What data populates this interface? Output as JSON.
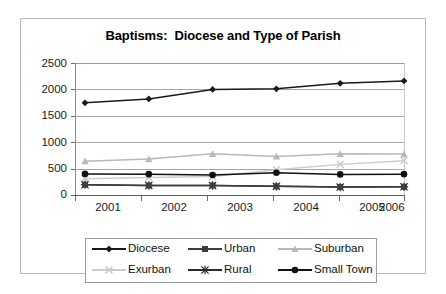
{
  "chart_data": {
    "type": "line",
    "title": "Baptisms:  Diocese and Type of Parish",
    "xlabel": "",
    "ylabel": "",
    "categories": [
      "2001",
      "2002",
      "2003",
      "2004",
      "2005",
      "2006"
    ],
    "ylim": [
      0,
      2500
    ],
    "yticks": [
      0,
      500,
      1000,
      1500,
      2000,
      2500
    ],
    "grid": true,
    "legend_position": "bottom",
    "series": [
      {
        "name": "Diocese",
        "marker": "diamond",
        "color": "#1a1a1a",
        "values": [
          1745,
          1820,
          2000,
          2010,
          2115,
          2160
        ]
      },
      {
        "name": "Urban",
        "marker": "square",
        "color": "#3d3d3d",
        "values": [
          195,
          180,
          180,
          165,
          150,
          155
        ]
      },
      {
        "name": "Suburban",
        "marker": "triangle",
        "color": "#b8b8b8",
        "values": [
          640,
          680,
          780,
          730,
          780,
          775
        ]
      },
      {
        "name": "Exurban",
        "marker": "cross-x",
        "color": "#cccccc",
        "values": [
          310,
          330,
          350,
          480,
          580,
          650
        ]
      },
      {
        "name": "Rural",
        "marker": "asterisk",
        "color": "#2b2b2b",
        "values": [
          195,
          180,
          180,
          165,
          150,
          155
        ]
      },
      {
        "name": "Small Town",
        "marker": "circle",
        "color": "#111111",
        "values": [
          400,
          395,
          380,
          420,
          390,
          395
        ]
      }
    ]
  },
  "legend": {
    "rows": [
      [
        {
          "label": "Diocese"
        },
        {
          "label": "Urban"
        },
        {
          "label": "Suburban"
        }
      ],
      [
        {
          "label": "Exurban"
        },
        {
          "label": "Rural"
        },
        {
          "label": "Small Town"
        }
      ]
    ]
  },
  "axes": {
    "ytick_labels": [
      "2500",
      "2000",
      "1500",
      "1000",
      "500",
      "0"
    ],
    "xtick_labels": [
      "2001",
      "2002",
      "2003",
      "2004",
      "2005",
      "2006"
    ]
  },
  "colors": {
    "diocese": "#1a1a1a",
    "urban": "#3d3d3d",
    "suburban": "#b8b8b8",
    "exurban": "#cccccc",
    "rural": "#2b2b2b",
    "small_town": "#111111",
    "gridline": "#a6a6a6",
    "frame": "#b9b9b9"
  }
}
